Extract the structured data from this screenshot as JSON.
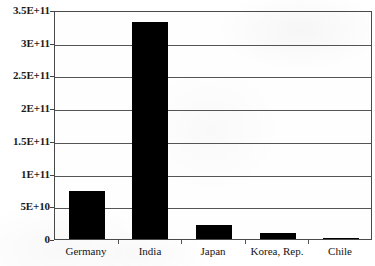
{
  "chart_data": {
    "type": "bar",
    "title": "",
    "xlabel": "",
    "ylabel": "",
    "categories": [
      "Germany",
      "India",
      "Japan",
      "Korea, Rep.",
      "Chile"
    ],
    "values": [
      73000000000,
      332000000000,
      21000000000,
      9000000000,
      1000000000
    ],
    "value_labels": [
      "7.3E+10",
      "3.32E+11",
      "2.1E+10",
      "9E+09",
      "1E+09"
    ],
    "ylim": [
      0,
      350000000000
    ],
    "ytick_values": [
      0,
      50000000000,
      100000000000,
      150000000000,
      200000000000,
      250000000000,
      300000000000,
      350000000000
    ],
    "ytick_labels": [
      "0",
      "5E+10",
      "1E+11",
      "1.5E+11",
      "2E+11",
      "2.5E+11",
      "3E+11",
      "3.5E+11"
    ],
    "grid": true,
    "legend": false,
    "legend_position": "none",
    "series": [
      {
        "name": "",
        "values": [
          73000000000,
          332000000000,
          21000000000,
          9000000000,
          1000000000
        ]
      }
    ],
    "bar_color": "#000000",
    "axis_color": "#4a4a4a",
    "plot_background": "#fefefe",
    "annotations": []
  },
  "cut_off_title": "",
  "axis": {
    "y_label_0": "0",
    "y_label_1": "5E+10",
    "y_label_2": "1E+11",
    "y_label_3": "1.5E+11",
    "y_label_4": "2E+11",
    "y_label_5": "2.5E+11",
    "y_label_6": "3E+11",
    "y_label_7": "3.5E+11"
  }
}
